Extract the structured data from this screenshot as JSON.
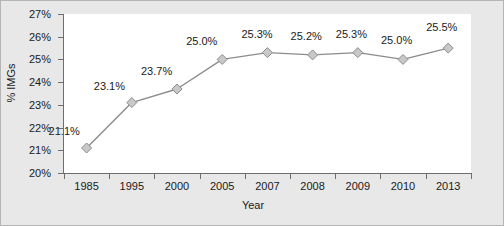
{
  "chart_data": {
    "type": "line",
    "title": "",
    "xlabel": "Year",
    "ylabel": "% IMGs",
    "categories": [
      "1985",
      "1995",
      "2000",
      "2005",
      "2007",
      "2008",
      "2009",
      "2010",
      "2013"
    ],
    "values": [
      21.1,
      23.1,
      23.7,
      25.0,
      25.3,
      25.2,
      25.3,
      25.0,
      25.5
    ],
    "data_labels": [
      "21.1%",
      "23.1%",
      "23.7%",
      "25.0%",
      "25.3%",
      "25.2%",
      "25.3%",
      "25.0%",
      "25.5%"
    ],
    "ylim": [
      20,
      27
    ],
    "ytick_labels": [
      "27%",
      "26%",
      "25%",
      "24%",
      "23%",
      "22%",
      "21%",
      "20%"
    ],
    "ytick_values": [
      27,
      26,
      25,
      24,
      23,
      22,
      21,
      20
    ],
    "grid": false,
    "legend": "none",
    "series_color": "#8c8c8c",
    "marker": "diamond",
    "marker_fill": "#c8c8c8",
    "marker_stroke": "#8c8c8c",
    "plot_background": "#ffffff",
    "figure_background": "#e8e8e8",
    "axis_color": "#6e6e6e",
    "text_color": "#1a1a1a"
  }
}
